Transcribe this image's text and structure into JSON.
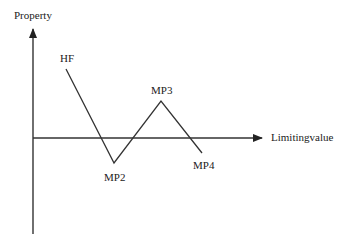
{
  "diagram": {
    "axes": {
      "y_label": "Property",
      "x_label": "Limitingvalue"
    },
    "points": [
      {
        "id": "HF",
        "label": "HF",
        "x": 66,
        "y": 69
      },
      {
        "id": "MP2",
        "label": "MP2",
        "x": 114,
        "y": 163
      },
      {
        "id": "MP3",
        "label": "MP3",
        "x": 161,
        "y": 101
      },
      {
        "id": "MP4",
        "label": "MP4",
        "x": 202,
        "y": 153
      }
    ],
    "colors": {
      "line": "#333333",
      "text": "#222222",
      "background": "#ffffff"
    }
  }
}
